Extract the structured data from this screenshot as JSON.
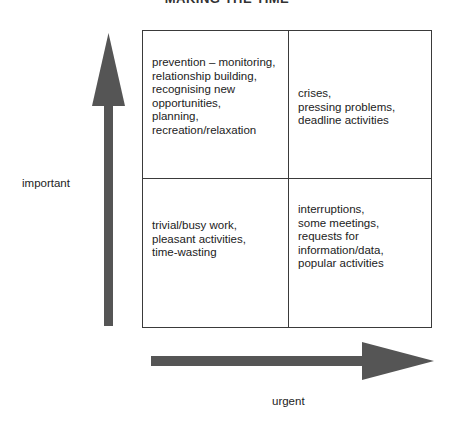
{
  "diagram": {
    "title": "MAKING THE TIME",
    "quadrants": {
      "important_not_urgent": {
        "text": "prevention –  monitoring,\nrelationship building,\nrecognising new\nopportunities,\nplanning,\nrecreation/relaxation"
      },
      "important_urgent": {
        "text": "crises,\npressing problems,\ndeadline activities"
      },
      "not_important_not_urgent": {
        "text": "trivial/busy work,\npleasant activities,\ntime-wasting"
      },
      "not_important_urgent": {
        "text": "interruptions,\nsome meetings,\nrequests for\ninformation/data,\npopular activities"
      }
    },
    "axes": {
      "vertical_label": "important",
      "horizontal_label": "urgent"
    },
    "colors": {
      "arrow": "#555555",
      "grid_line": "#3a3a3a",
      "text": "#222222"
    }
  }
}
